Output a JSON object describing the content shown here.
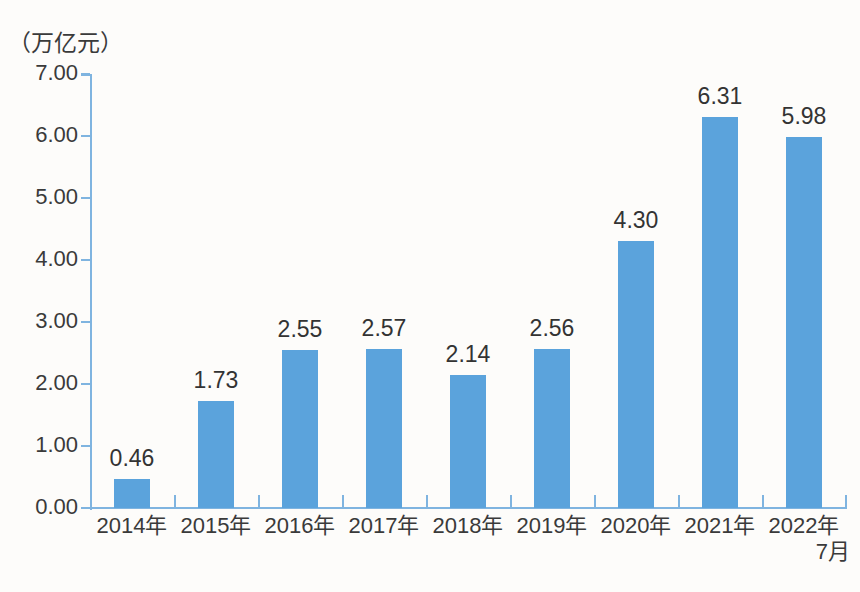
{
  "chart_data": {
    "type": "bar",
    "title": "",
    "subtitle": "",
    "unit_label": "（万亿元）",
    "xlabel": "",
    "ylabel": "",
    "ylim": [
      0.0,
      7.0
    ],
    "y_tick_step": 1.0,
    "grid": false,
    "legend": false,
    "legend_position": "none",
    "bar_color": "#5ba3dc",
    "axis_color": "#7fb4e0",
    "label_color": "#333333",
    "background_color": "#fdfcfa",
    "categories": [
      "2014年",
      "2015年",
      "2016年",
      "2017年",
      "2018年",
      "2019年",
      "2020年",
      "2021年",
      "2022年\n7月"
    ],
    "category_lines": [
      [
        "2014年"
      ],
      [
        "2015年"
      ],
      [
        "2016年"
      ],
      [
        "2017年"
      ],
      [
        "2018年"
      ],
      [
        "2019年"
      ],
      [
        "2020年"
      ],
      [
        "2021年"
      ],
      [
        "2022年",
        "7月"
      ]
    ],
    "values": [
      0.46,
      1.73,
      2.55,
      2.57,
      2.14,
      2.56,
      4.3,
      6.31,
      5.98
    ],
    "data_labels": [
      "0.46",
      "1.73",
      "2.55",
      "2.57",
      "2.14",
      "2.56",
      "4.30",
      "6.31",
      "5.98"
    ],
    "y_tick_labels": [
      "0.00",
      "1.00",
      "2.00",
      "3.00",
      "4.00",
      "5.00",
      "6.00",
      "7.00"
    ],
    "y_tick_values": [
      0.0,
      1.0,
      2.0,
      3.0,
      4.0,
      5.0,
      6.0,
      7.0
    ]
  }
}
